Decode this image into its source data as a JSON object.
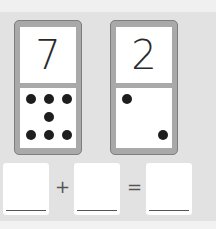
{
  "dominoes": [
    {
      "top_number": "7",
      "dot_count": 7
    },
    {
      "top_number": "2",
      "dot_count": 2
    }
  ],
  "equation": {
    "plus": "+",
    "equals": "=",
    "boxes": [
      "",
      "",
      ""
    ]
  }
}
